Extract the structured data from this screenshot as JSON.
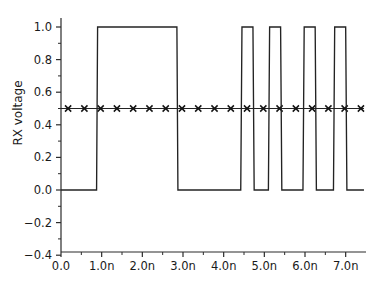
{
  "chart_data": {
    "type": "line",
    "title": "",
    "xlabel": "",
    "ylabel": "RX voltage",
    "xlim": [
      0.0,
      7.5
    ],
    "ylim": [
      -0.4,
      1.1
    ],
    "grid": false,
    "legend": "none",
    "x_unit": "n",
    "x_tick_labels": [
      "0.0",
      "1.0n",
      "2.0n",
      "3.0n",
      "4.0n",
      "5.0n",
      "6.0n",
      "7.0n"
    ],
    "x_tick_values": [
      0.0,
      1.0,
      2.0,
      3.0,
      4.0,
      5.0,
      6.0,
      7.0
    ],
    "x_minor_step": 0.5,
    "y_tick_labels": [
      "1.0",
      "0.8",
      "0.6",
      "0.4",
      "0.2",
      "0.0",
      "−0.2",
      "−0.4"
    ],
    "y_tick_values": [
      1.0,
      0.8,
      0.6,
      0.4,
      0.2,
      0.0,
      -0.2,
      -0.4
    ],
    "y_minor_step": 0.1,
    "series": [
      {
        "name": "RX voltage",
        "style": "step",
        "color": "#232323",
        "points": [
          [
            0.0,
            0.0
          ],
          [
            0.875,
            0.0
          ],
          [
            0.9,
            1.0
          ],
          [
            2.85,
            1.0
          ],
          [
            2.875,
            0.0
          ],
          [
            4.42,
            0.0
          ],
          [
            4.45,
            1.0
          ],
          [
            4.72,
            1.0
          ],
          [
            4.75,
            0.0
          ],
          [
            5.1,
            0.0
          ],
          [
            5.13,
            1.0
          ],
          [
            5.4,
            1.0
          ],
          [
            5.43,
            0.0
          ],
          [
            5.95,
            0.0
          ],
          [
            5.98,
            1.0
          ],
          [
            6.25,
            1.0
          ],
          [
            6.28,
            0.0
          ],
          [
            6.7,
            0.0
          ],
          [
            6.73,
            1.0
          ],
          [
            7.0,
            1.0
          ],
          [
            7.03,
            0.0
          ],
          [
            7.45,
            0.0
          ]
        ]
      },
      {
        "name": "threshold",
        "style": "line-with-x-markers",
        "color": "#141414",
        "constant_y": 0.5,
        "x_start": 0.0,
        "x_end": 7.45,
        "marker": "x",
        "marker_x_start": 0.175,
        "marker_x_step": 0.4,
        "marker_count": 19
      }
    ]
  }
}
